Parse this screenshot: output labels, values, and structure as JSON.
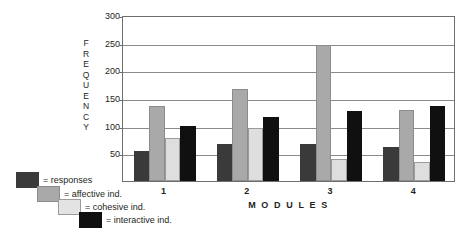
{
  "chart_data": {
    "type": "bar",
    "title": "",
    "xlabel": "M O D U L E S",
    "ylabel": "FREQUENCY",
    "ylabel_letters": [
      "F",
      "R",
      "E",
      "Q",
      "U",
      "E",
      "N",
      "C",
      "Y"
    ],
    "categories": [
      "1",
      "2",
      "3",
      "4"
    ],
    "yticks": [
      50,
      100,
      150,
      200,
      250,
      300
    ],
    "ylim": [
      0,
      300
    ],
    "grid": true,
    "legend_position": "bottom-left",
    "series": [
      {
        "name": "responses",
        "color": "#3a3a3a",
        "values": [
          55,
          67,
          66,
          62
        ]
      },
      {
        "name": "affective ind.",
        "color": "#a9a9a9",
        "values": [
          135,
          167,
          245,
          128
        ]
      },
      {
        "name": "cohesive ind.",
        "color": "#dedede",
        "values": [
          77,
          96,
          40,
          34
        ]
      },
      {
        "name": "interactive ind.",
        "color": "#101010",
        "values": [
          99,
          115,
          126,
          136
        ]
      }
    ]
  },
  "legend": {
    "entries": [
      {
        "label": "= responses"
      },
      {
        "label": "= affective ind."
      },
      {
        "label": "= cohesive ind."
      },
      {
        "label": "= interactive ind."
      }
    ]
  }
}
